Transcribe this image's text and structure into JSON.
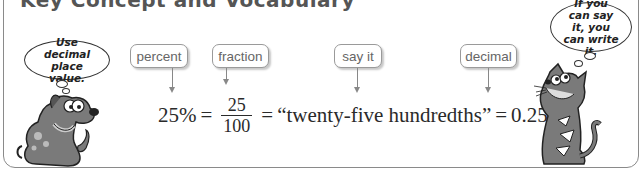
{
  "header": {
    "title": "Key Concept and Vocabulary"
  },
  "characters": {
    "dog": {
      "thought": "Use decimal place value.",
      "icon": "dog-icon"
    },
    "cat": {
      "thought": "If you can say it, you can write it.",
      "icon": "cat-icon"
    }
  },
  "labels": [
    {
      "text": "percent"
    },
    {
      "text": "fraction"
    },
    {
      "text": "say it"
    },
    {
      "text": "decimal"
    }
  ],
  "equation": {
    "percent": "25%",
    "eq1": "=",
    "fraction_numerator": "25",
    "fraction_denominator": "100",
    "eq2": "=",
    "words": "“twenty-five hundredths”",
    "eq3": "=",
    "decimal": "0.25"
  },
  "colors": {
    "border": "#8a8a8a",
    "character_fill": "#7a7a7a",
    "text": "#2a2a2a"
  }
}
